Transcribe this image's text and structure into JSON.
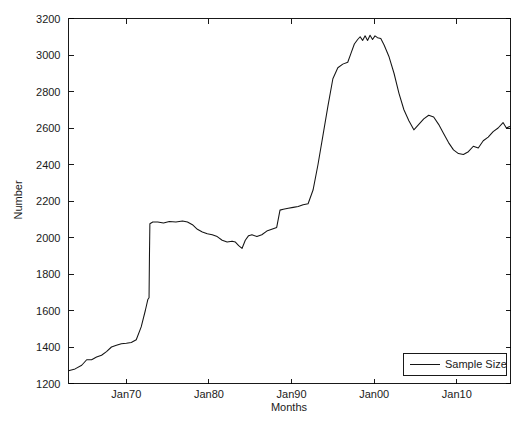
{
  "chart_data": {
    "type": "line",
    "title": "",
    "xlabel": "Months",
    "ylabel": "Number",
    "xlim": [
      1963.0,
      2016.5
    ],
    "ylim": [
      1200,
      3200
    ],
    "grid": false,
    "legend_position": "bottom-right",
    "y_ticks": [
      1200,
      1400,
      1600,
      1800,
      2000,
      2200,
      2400,
      2600,
      2800,
      3000,
      3200
    ],
    "y_tick_labels": [
      "1200",
      "1400",
      "1600",
      "1800",
      "2000",
      "2200",
      "2400",
      "2600",
      "2800",
      "3000",
      "3200"
    ],
    "x_ticks": [
      1970,
      1980,
      1990,
      2000,
      2010
    ],
    "x_tick_labels": [
      "Jan70",
      "Jan80",
      "Jan90",
      "Jan00",
      "Jan10"
    ],
    "series": [
      {
        "name": "Sample Size",
        "color": "#141414",
        "x": [
          1963.0,
          1963.8,
          1964.6,
          1965.2,
          1965.8,
          1966.4,
          1967.0,
          1967.6,
          1968.2,
          1968.8,
          1969.4,
          1970.0,
          1970.6,
          1971.2,
          1971.8,
          1972.3,
          1972.6,
          1972.75,
          1972.8,
          1972.85,
          1973.2,
          1973.8,
          1974.5,
          1975.2,
          1976.0,
          1976.8,
          1977.4,
          1978.0,
          1978.6,
          1979.2,
          1979.8,
          1980.4,
          1981.0,
          1981.6,
          1982.2,
          1982.8,
          1983.2,
          1983.6,
          1984.0,
          1984.4,
          1984.8,
          1985.2,
          1985.8,
          1986.4,
          1987.0,
          1987.6,
          1988.2,
          1988.6,
          1989.0,
          1989.6,
          1990.2,
          1990.8,
          1991.4,
          1992.0,
          1992.6,
          1993.2,
          1993.8,
          1994.4,
          1995.0,
          1995.6,
          1996.2,
          1996.8,
          1997.2,
          1997.6,
          1998.0,
          1998.3,
          1998.6,
          1998.9,
          1999.2,
          1999.5,
          1999.8,
          2000.1,
          2000.4,
          2000.8,
          2001.2,
          2001.8,
          2002.4,
          2003.0,
          2003.6,
          2004.2,
          2004.8,
          2005.4,
          2006.0,
          2006.6,
          2007.2,
          2007.8,
          2008.4,
          2009.0,
          2009.6,
          2010.2,
          2010.8,
          2011.4,
          2012.0,
          2012.6,
          2013.2,
          2013.8,
          2014.4,
          2015.0,
          2015.6,
          2016.0,
          2016.5
        ],
        "y": [
          1270,
          1280,
          1300,
          1330,
          1330,
          1345,
          1355,
          1375,
          1400,
          1410,
          1418,
          1420,
          1425,
          1440,
          1510,
          1600,
          1660,
          1670,
          1900,
          2075,
          2085,
          2085,
          2080,
          2088,
          2085,
          2090,
          2085,
          2070,
          2045,
          2030,
          2020,
          2015,
          2005,
          1985,
          1975,
          1980,
          1975,
          1955,
          1940,
          1985,
          2010,
          2015,
          2005,
          2015,
          2035,
          2045,
          2055,
          2150,
          2155,
          2160,
          2165,
          2170,
          2180,
          2185,
          2260,
          2400,
          2560,
          2720,
          2870,
          2930,
          2950,
          2960,
          3010,
          3060,
          3085,
          3100,
          3080,
          3105,
          3080,
          3108,
          3085,
          3105,
          3095,
          3090,
          3055,
          2990,
          2900,
          2790,
          2700,
          2640,
          2590,
          2620,
          2650,
          2670,
          2660,
          2620,
          2570,
          2520,
          2480,
          2460,
          2455,
          2470,
          2500,
          2490,
          2530,
          2550,
          2580,
          2600,
          2630,
          2600,
          2610
        ]
      }
    ]
  },
  "legend": {
    "entries": [
      {
        "label": "Sample Size"
      }
    ]
  },
  "axes": {
    "y_title": "Number",
    "x_title": "Months"
  }
}
